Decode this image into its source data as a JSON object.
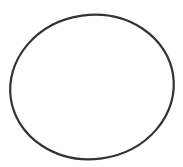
{
  "canvas": {
    "width": 183,
    "height": 167,
    "background": "#ffffff"
  },
  "shape": {
    "type": "ellipse",
    "cx": 92,
    "cy": 87,
    "rx": 82,
    "ry": 72,
    "rotation_deg": -8,
    "stroke": "#333333",
    "stroke_width": 2.2,
    "fill": "none"
  }
}
